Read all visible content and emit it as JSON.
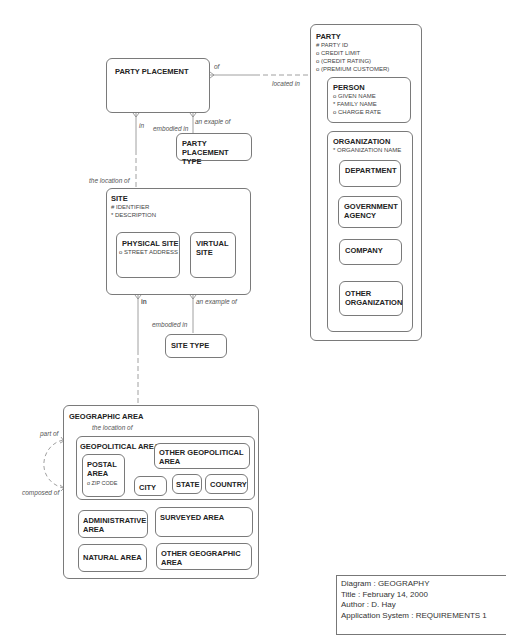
{
  "entities": {
    "party": {
      "title": "PARTY",
      "attributes": [
        "# PARTY ID",
        "o CREDIT LIMIT",
        "o (CREDIT RATING)",
        "o (PREMIUM CUSTOMER)"
      ],
      "person": {
        "title": "PERSON",
        "attributes": [
          "o GIVEN NAME",
          "* FAMILY NAME",
          "o CHARGE RATE"
        ]
      },
      "organization": {
        "title": "ORGANIZATION",
        "attributes": [
          "* ORGANIZATION NAME"
        ],
        "department": "DEPARTMENT",
        "government_agency": "GOVERNMENT\nAGENCY",
        "company": "COMPANY",
        "other_organization": "OTHER\nORGANIZATION"
      }
    },
    "party_placement": {
      "title": "PARTY PLACEMENT"
    },
    "party_placement_type": {
      "title": "PARTY PLACEMENT\nTYPE"
    },
    "site": {
      "title": "SITE",
      "attributes": [
        "# IDENTIFIER",
        "* DESCRIPTION"
      ],
      "physical_site": {
        "title": "PHYSICAL SITE",
        "attributes": [
          "o STREET ADDRESS"
        ]
      },
      "virtual_site": {
        "title": "VIRTUAL\nSITE"
      }
    },
    "site_type": {
      "title": "SITE TYPE"
    },
    "geographic_area": {
      "title": "GEOGRAPHIC AREA",
      "geopolitical_area": {
        "title": "GEOPOLITICAL AREA",
        "postal_area": {
          "title": "POSTAL\nAREA",
          "attributes": [
            "o ZIP CODE"
          ]
        },
        "other_geopolitical_area": "OTHER GEOPOLITICAL\nAREA",
        "city": "CITY",
        "state": "STATE",
        "country": "COUNTRY"
      },
      "administrative_area": "ADMINISTRATIVE\nAREA",
      "surveyed_area": "SURVEYED AREA",
      "natural_area": "NATURAL AREA",
      "other_geographic_area": "OTHER GEOGRAPHIC\nAREA"
    }
  },
  "relationships": {
    "pp_party_of": "of",
    "pp_party_located_in": "located in",
    "pp_site_in": "in",
    "pp_site_location_of": "the location of",
    "pp_type_example_of": "an exaple of",
    "pp_type_embodied_in": "embodied in",
    "site_geo_in": "in",
    "site_geo_location_of": "the location of",
    "site_type_example_of": "an example of",
    "site_type_embodied_in": "embodied in",
    "geo_part_of": "part of",
    "geo_composed_of": "composed of"
  },
  "legend": {
    "diagram": "Diagram : GEOGRAPHY",
    "title": "Title : February 14, 2000",
    "author": "Author : D. Hay",
    "application_system": "Application System : REQUIREMENTS 1"
  }
}
